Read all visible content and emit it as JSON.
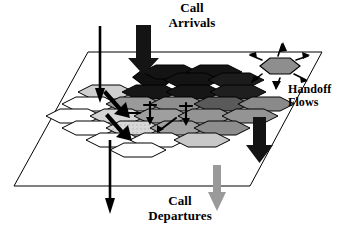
{
  "figure": {
    "background_color": "#ffffff",
    "stroke_color": "#000000"
  },
  "labels": {
    "call_arrivals": {
      "line1": "Call",
      "line2": "Arrivals"
    },
    "call_departures": {
      "line1": "Call",
      "line2": "Departures"
    },
    "handoff_flows": {
      "line1": "Handoff",
      "line2": "Flows"
    }
  },
  "colors": {
    "black": "#111111",
    "dark_gray": "#4a4a4a",
    "mid_gray": "#8f8f8f",
    "light_gray": "#c9c9c9",
    "pale_gray": "#e3e3e3",
    "white": "#ffffff",
    "arrow_gray": "#9a9a9a",
    "outline": "#000000"
  },
  "plane": {
    "name": "service-area-plane",
    "points": "88,52 322,52 250,186 14,186"
  },
  "hexagons": [
    {
      "id": "r1c1",
      "cx": 146,
      "cy": 82,
      "fill": "black"
    },
    {
      "id": "r1c2",
      "cx": 178,
      "cy": 82,
      "fill": "black"
    },
    {
      "id": "r1c3",
      "cx": 210,
      "cy": 82,
      "fill": "black"
    },
    {
      "id": "r2c0",
      "cx": 98,
      "cy": 97,
      "fill": "light_gray"
    },
    {
      "id": "r2c1",
      "cx": 130,
      "cy": 97,
      "fill": "black"
    },
    {
      "id": "r2c2",
      "cx": 162,
      "cy": 97,
      "fill": "black"
    },
    {
      "id": "r2c3",
      "cx": 194,
      "cy": 97,
      "fill": "black"
    },
    {
      "id": "r2c4",
      "cx": 226,
      "cy": 97,
      "fill": "dark_gray"
    },
    {
      "id": "r3c0",
      "cx": 82,
      "cy": 112,
      "fill": "white"
    },
    {
      "id": "r3c1",
      "cx": 114,
      "cy": 112,
      "fill": "mid_gray"
    },
    {
      "id": "r3c2",
      "cx": 146,
      "cy": 112,
      "fill": "mid_gray"
    },
    {
      "id": "r3c3",
      "cx": 178,
      "cy": 112,
      "fill": "dark_gray"
    },
    {
      "id": "r3c4",
      "cx": 210,
      "cy": 112,
      "fill": "dark_gray"
    },
    {
      "id": "r3c5",
      "cx": 242,
      "cy": 112,
      "fill": "mid_gray"
    },
    {
      "id": "r4c0",
      "cx": 66,
      "cy": 127,
      "fill": "white"
    },
    {
      "id": "r4c1",
      "cx": 98,
      "cy": 127,
      "fill": "white"
    },
    {
      "id": "r4c2",
      "cx": 130,
      "cy": 127,
      "fill": "light_gray"
    },
    {
      "id": "r4c3",
      "cx": 162,
      "cy": 127,
      "fill": "mid_gray"
    },
    {
      "id": "r4c4",
      "cx": 194,
      "cy": 127,
      "fill": "mid_gray"
    },
    {
      "id": "r4c5",
      "cx": 226,
      "cy": 127,
      "fill": "mid_gray"
    },
    {
      "id": "r5c1",
      "cx": 114,
      "cy": 142,
      "fill": "white"
    },
    {
      "id": "r5c2",
      "cx": 146,
      "cy": 142,
      "fill": "light_gray"
    },
    {
      "id": "r5c3",
      "cx": 178,
      "cy": 142,
      "fill": "mid_gray"
    },
    {
      "id": "r5c4",
      "cx": 210,
      "cy": 142,
      "fill": "mid_gray"
    },
    {
      "id": "r6c2",
      "cx": 130,
      "cy": 157,
      "fill": "white"
    },
    {
      "id": "r6c3",
      "cx": 162,
      "cy": 157,
      "fill": "white"
    },
    {
      "id": "r6c4",
      "cx": 194,
      "cy": 157,
      "fill": "light_gray"
    }
  ],
  "inset_cell": {
    "name": "handoff-cell-inset",
    "cx": 278,
    "cy": 66,
    "fill": "mid_gray",
    "arrow_count": 6
  },
  "arrows": {
    "call_arrivals": {
      "x": 143,
      "y_top": 25,
      "y_bottom": 74,
      "color": "black",
      "style": "thick-block"
    },
    "handoff_right": {
      "x": 259,
      "y_top": 117,
      "y_bottom": 163,
      "color": "black",
      "style": "thick-block"
    },
    "call_departures": {
      "x": 217,
      "y_top": 165,
      "y_bottom": 212,
      "color": "arrow_gray",
      "style": "thin-block"
    },
    "through_line": {
      "x": 100,
      "y_top": 26,
      "y_bottom": 214,
      "color": "black",
      "style": "line-double-head"
    }
  },
  "internal_handoff_arrows": 6
}
